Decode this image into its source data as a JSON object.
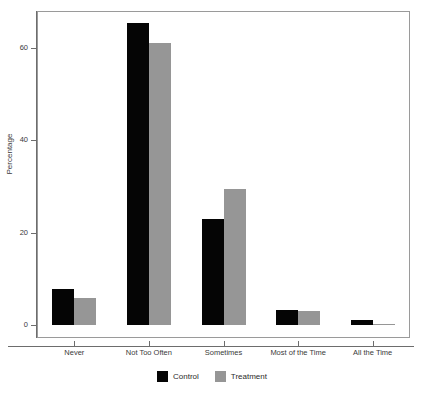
{
  "chart_data": {
    "type": "bar",
    "title": "",
    "xlabel": "",
    "ylabel": "Percentage",
    "categories": [
      "Never",
      "Not Too Often",
      "Sometimes",
      "Most of the Time",
      "All the Time"
    ],
    "series": [
      {
        "name": "Control",
        "color": "#050505",
        "values": [
          7.8,
          65.5,
          23.0,
          3.2,
          1.0
        ]
      },
      {
        "name": "Treatment",
        "color": "#969696",
        "values": [
          5.9,
          61.0,
          29.5,
          3.1,
          0.3
        ]
      }
    ],
    "ylim": [
      0,
      68
    ],
    "yticks": [
      0,
      20,
      40,
      60
    ],
    "ytick_labels": [
      "0",
      "20",
      "40",
      "60"
    ],
    "grid": false,
    "legend_position": "bottom",
    "legend_entries": [
      "Control",
      "Treatment"
    ]
  }
}
